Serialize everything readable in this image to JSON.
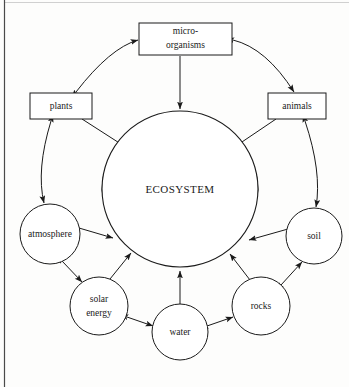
{
  "diagram": {
    "title": "ECOSYSTEM",
    "type": "cycle-diagram",
    "center": {
      "id": "ecosystem",
      "label": "ECOSYSTEM",
      "shape": "circle",
      "cx": 180,
      "cy": 189,
      "r": 78
    },
    "boxes": [
      {
        "id": "micro-organisms",
        "label_line1": "micro-",
        "label_line2": "organisms",
        "shape": "rectangle",
        "x": 139,
        "y": 23,
        "w": 93,
        "h": 32
      },
      {
        "id": "plants",
        "label": "plants",
        "shape": "rectangle",
        "x": 30,
        "y": 93,
        "w": 62,
        "h": 26
      },
      {
        "id": "animals",
        "label": "animals",
        "shape": "rectangle",
        "x": 268,
        "y": 93,
        "w": 58,
        "h": 26
      }
    ],
    "circles": [
      {
        "id": "atmosphere",
        "label": "atmosphere",
        "shape": "circle",
        "cx": 50,
        "cy": 234,
        "r": 30
      },
      {
        "id": "soil",
        "label": "soil",
        "shape": "circle",
        "cx": 314,
        "cy": 236,
        "r": 28
      },
      {
        "id": "solar-energy",
        "label_line1": "solar",
        "label_line2": "energy",
        "shape": "circle",
        "cx": 99,
        "cy": 306,
        "r": 29
      },
      {
        "id": "water",
        "label": "water",
        "shape": "circle",
        "cx": 180,
        "cy": 332,
        "r": 28
      },
      {
        "id": "rocks",
        "label": "rocks",
        "shape": "circle",
        "cx": 261,
        "cy": 306,
        "r": 29
      }
    ],
    "connections": [
      {
        "from": "plants",
        "to": "micro-organisms",
        "style": "curved",
        "arrows": "both"
      },
      {
        "from": "micro-organisms",
        "to": "animals",
        "style": "curved",
        "arrows": "both"
      },
      {
        "from": "micro-organisms",
        "to": "ecosystem",
        "style": "straight",
        "arrows": "to"
      },
      {
        "from": "plants",
        "to": "ecosystem",
        "style": "straight",
        "arrows": "to"
      },
      {
        "from": "animals",
        "to": "ecosystem",
        "style": "straight",
        "arrows": "to"
      },
      {
        "from": "plants",
        "to": "atmosphere",
        "style": "curved",
        "arrows": "both"
      },
      {
        "from": "animals",
        "to": "soil",
        "style": "curved",
        "arrows": "both"
      },
      {
        "from": "atmosphere",
        "to": "ecosystem",
        "style": "straight",
        "arrows": "to"
      },
      {
        "from": "soil",
        "to": "ecosystem",
        "style": "straight",
        "arrows": "to"
      },
      {
        "from": "atmosphere",
        "to": "solar-energy",
        "style": "straight",
        "arrows": "both"
      },
      {
        "from": "solar-energy",
        "to": "water",
        "style": "straight",
        "arrows": "both"
      },
      {
        "from": "water",
        "to": "rocks",
        "style": "straight",
        "arrows": "both"
      },
      {
        "from": "rocks",
        "to": "soil",
        "style": "straight",
        "arrows": "both"
      },
      {
        "from": "solar-energy",
        "to": "ecosystem",
        "style": "straight",
        "arrows": "to"
      },
      {
        "from": "water",
        "to": "ecosystem",
        "style": "straight",
        "arrows": "to"
      },
      {
        "from": "rocks",
        "to": "ecosystem",
        "style": "straight",
        "arrows": "to"
      },
      {
        "from": "ecosystem",
        "to": "ecosystem",
        "style": "arc-left",
        "arrows": "both"
      },
      {
        "from": "ecosystem",
        "to": "ecosystem",
        "style": "arc-right",
        "arrows": "both"
      }
    ],
    "colors": {
      "stroke": "#1a1a1a",
      "fill": "#ffffff",
      "background": "#fdfdfc",
      "border": "#4a4a4a"
    }
  }
}
